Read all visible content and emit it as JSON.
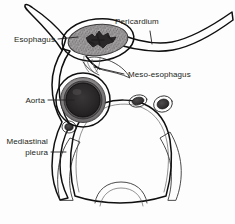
{
  "figure": {
    "background_color": "#fdfdfd",
    "line_color": "#100f10",
    "text_color": "#231f20"
  },
  "labels": {
    "pericardium": "Pericardium",
    "esophagus": "Esophagus",
    "meso_esophagus": "Meso-esophagus",
    "aorta": "Aorta",
    "mediastinal_pleura_line1": "Mediastinal",
    "mediastinal_pleura_line2": "pleura"
  },
  "structures": [
    {
      "name": "pericardium",
      "label": "Pericardium",
      "description": "thin fibrous band sweeping to upper right",
      "fill": "#ebebeb"
    },
    {
      "name": "esophagus",
      "label": "Esophagus",
      "description": "oval muscular tube with stellate lumen",
      "fill": "#9a9a9a",
      "lumen_fill": "#2c2a2b"
    },
    {
      "name": "meso-esophagus",
      "label": "Meso-esophagus",
      "description": "mesentery-like fold suspending esophagus",
      "fill": "#f0f0f0"
    },
    {
      "name": "aorta",
      "label": "Aorta",
      "description": "descending thoracic aorta, dark circular lumen",
      "fill": "#2a2829",
      "wall_fill": "#6f6d6e"
    },
    {
      "name": "mediastinal-pleura",
      "label": "Mediastinal pleura",
      "description": "thin membrane outlining left mediastinal border",
      "fill": "#efefef"
    },
    {
      "name": "vertebral-body",
      "label": "",
      "description": "dome-shaped vertebral body with trabecular stipple",
      "fill": "#fafafa"
    },
    {
      "name": "azygos-vein",
      "label": "",
      "description": "small dark vessel right of vertebral body",
      "fill": "#3a3738"
    },
    {
      "name": "thoracic-duct",
      "label": "",
      "description": "small dark vessel adjacent to azygos",
      "fill": "#3a3738"
    },
    {
      "name": "left-small-vessel",
      "label": "",
      "description": "small dark vessel on left paravertebral region",
      "fill": "#3a3738"
    },
    {
      "name": "vertebral-canal",
      "label": "",
      "description": "arch of vertebral canal at inferior border",
      "fill": "#fdfdfd"
    }
  ]
}
